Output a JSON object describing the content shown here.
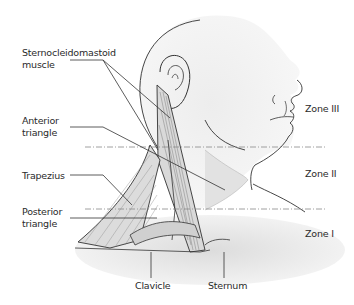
{
  "diagram": {
    "labels": {
      "sternocleidomastoid": [
        "Sternocleidomastoid",
        "muscle"
      ],
      "anterior_triangle": [
        "Anterior",
        "triangle"
      ],
      "trapezius": "Trapezius",
      "posterior_triangle": [
        "Posterior",
        "triangle"
      ],
      "clavicle": "Clavicle",
      "sternum": "Sternum"
    },
    "zones": [
      {
        "name": "Zone III"
      },
      {
        "name": "Zone II"
      },
      {
        "name": "Zone I"
      }
    ],
    "colors": {
      "line": "#333333",
      "shade": "#d6d6d6",
      "light_shade": "#ebebeb",
      "text": "#2a2a2a"
    }
  }
}
